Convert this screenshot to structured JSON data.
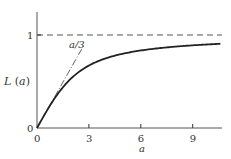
{
  "chart_data": {
    "type": "line",
    "title": "",
    "xlabel": "a",
    "ylabel": "L (a)",
    "xlim": [
      0,
      10.8
    ],
    "ylim": [
      0,
      1.2
    ],
    "x_ticks": [
      {
        "value": 0,
        "label": "0"
      },
      {
        "value": 3,
        "label": "3"
      },
      {
        "value": 6,
        "label": "6"
      },
      {
        "value": 9,
        "label": "9"
      }
    ],
    "y_ticks": [
      {
        "value": 0,
        "label": "0"
      },
      {
        "value": 1,
        "label": "1"
      }
    ],
    "grid": false,
    "series": [
      {
        "name": "L(a)",
        "style": "solid",
        "function": "coth(a) - 1/a",
        "x": [
          0,
          0.5,
          1,
          1.5,
          2,
          3,
          4,
          5,
          6,
          7,
          8,
          9,
          10,
          10.6
        ],
        "values": [
          0,
          0.164,
          0.313,
          0.438,
          0.537,
          0.672,
          0.751,
          0.8,
          0.834,
          0.857,
          0.875,
          0.889,
          0.9,
          0.906
        ]
      },
      {
        "name": "a/3",
        "style": "dashdot",
        "x": [
          0,
          2.7
        ],
        "values": [
          0,
          0.9
        ]
      },
      {
        "name": "asymptote",
        "style": "dashed",
        "x": [
          0,
          10.8
        ],
        "values": [
          1,
          1
        ]
      }
    ],
    "annotations": [
      {
        "text": "a/3",
        "x": 2.1,
        "y": 0.93
      }
    ]
  },
  "labels": {
    "ylabel": "L (a)",
    "xlabel": "a",
    "asymptote_label": "1",
    "origin_y": "0",
    "line_label": "a/3"
  }
}
